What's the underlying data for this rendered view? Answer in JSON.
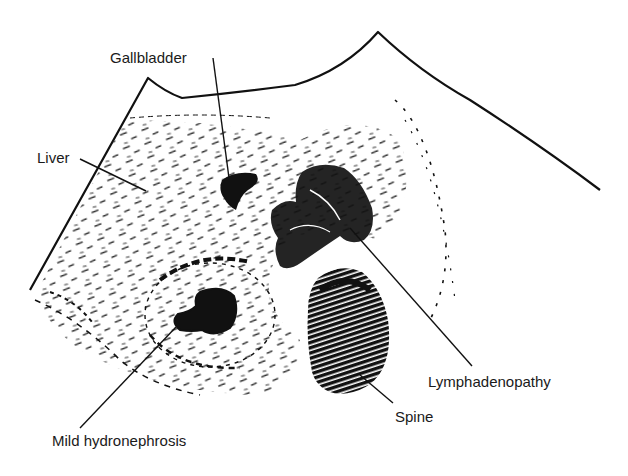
{
  "figure": {
    "type": "ultrasound-schematic",
    "ink_color": "#111111",
    "background_color": "#ffffff",
    "labels": [
      {
        "id": "gallbladder",
        "text": "Gallbladder",
        "x": 110,
        "y": 50
      },
      {
        "id": "liver",
        "text": "Liver",
        "x": 37,
        "y": 150
      },
      {
        "id": "lymphadenopathy",
        "text": "Lymphadenopathy",
        "x": 428,
        "y": 374
      },
      {
        "id": "spine",
        "text": "Spine",
        "x": 395,
        "y": 409
      },
      {
        "id": "mild-hydronephrosis",
        "text": "Mild hydronephrosis",
        "x": 52,
        "y": 433
      }
    ]
  }
}
